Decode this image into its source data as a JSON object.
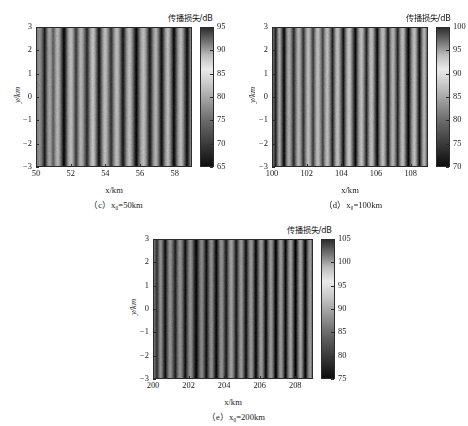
{
  "figure": {
    "colorbar_title": "传播损失/dB",
    "xlabel": "x/km",
    "ylabel": "y/km"
  },
  "chart_data": [
    {
      "type": "heatmap",
      "panel_id": "c",
      "title": "",
      "caption": "（c）x₀=50km",
      "caption_plain": "(c) x0=50km",
      "xlabel": "x/km",
      "ylabel": "y/km",
      "colorbar_label": "传播损失/dB",
      "xlim": [
        50,
        59
      ],
      "ylim": [
        -3,
        3
      ],
      "xticks": [
        50,
        52,
        54,
        56,
        58
      ],
      "yticks": [
        3,
        2,
        1,
        0,
        -1,
        -2,
        -3
      ],
      "clim": [
        65,
        95
      ],
      "cbticks": [
        65,
        70,
        75,
        80,
        85,
        90,
        95
      ],
      "grid": false,
      "colormap": "gray",
      "description": "Vertical interference striations of propagation loss; values ~65-95 dB, invariant in y.",
      "stripe_profile_db": [
        80,
        79,
        78,
        80,
        83,
        87,
        92,
        88,
        82,
        78,
        76,
        77,
        80,
        84,
        82,
        78,
        75,
        74,
        76,
        80,
        85,
        90,
        94,
        91,
        86,
        80,
        76,
        74,
        73,
        75,
        79,
        84,
        88,
        85,
        80,
        76,
        74,
        75,
        78,
        82,
        86,
        90,
        87,
        82,
        77,
        74,
        72,
        74,
        78,
        83,
        88,
        93,
        89,
        84,
        79,
        75,
        73,
        74,
        77,
        81,
        85,
        89,
        86,
        81,
        77,
        74,
        73,
        75,
        79,
        84,
        89,
        92,
        88,
        83,
        78,
        75,
        73,
        74,
        77,
        81,
        86,
        91,
        94,
        90,
        85,
        80,
        76,
        74,
        73,
        75,
        78,
        83,
        88,
        92,
        89,
        84,
        79,
        76,
        74,
        76,
        80,
        85,
        90,
        93,
        88,
        83,
        78,
        75,
        73,
        75,
        79,
        84,
        89,
        94,
        90,
        85,
        80,
        76,
        74,
        73,
        76,
        80,
        85,
        90,
        93,
        89,
        84,
        79
      ]
    },
    {
      "type": "heatmap",
      "panel_id": "d",
      "title": "",
      "caption": "（d）x₀=100km",
      "caption_plain": "(d) x0=100km",
      "xlabel": "x/km",
      "ylabel": "y/km",
      "colorbar_label": "传播损失/dB",
      "xlim": [
        100,
        109
      ],
      "ylim": [
        -3,
        3
      ],
      "xticks": [
        100,
        102,
        104,
        106,
        108
      ],
      "yticks": [
        3,
        2,
        1,
        0,
        -1,
        -2,
        -3
      ],
      "clim": [
        70,
        100
      ],
      "cbticks": [
        70,
        75,
        80,
        85,
        90,
        95,
        100
      ],
      "grid": false,
      "colormap": "gray",
      "description": "Vertical interference striations of propagation loss; values ~70-100 dB, invariant in y.",
      "stripe_profile_db": [
        88,
        92,
        96,
        90,
        84,
        80,
        83,
        89,
        95,
        99,
        93,
        86,
        82,
        80,
        82,
        86,
        91,
        95,
        90,
        85,
        81,
        79,
        81,
        85,
        90,
        94,
        89,
        84,
        80,
        78,
        80,
        84,
        89,
        93,
        88,
        83,
        79,
        78,
        80,
        84,
        88,
        92,
        87,
        82,
        79,
        78,
        81,
        86,
        91,
        96,
        91,
        85,
        80,
        78,
        79,
        83,
        88,
        93,
        98,
        92,
        86,
        81,
        78,
        77,
        80,
        85,
        90,
        95,
        99,
        93,
        87,
        82,
        79,
        78,
        80,
        85,
        90,
        96,
        91,
        85,
        80,
        78,
        79,
        83,
        89,
        94,
        99,
        93,
        87,
        82,
        79,
        78,
        81,
        86,
        92,
        97,
        91,
        85,
        81,
        79,
        81,
        86,
        91,
        96,
        90,
        84,
        80,
        78,
        80,
        85,
        91,
        96,
        99,
        93,
        87,
        82,
        79,
        78,
        81,
        87,
        93,
        98,
        92,
        86,
        81,
        79,
        82,
        88
      ]
    },
    {
      "type": "heatmap",
      "panel_id": "e",
      "title": "",
      "caption": "（e）x₀=200km",
      "caption_plain": "(e) x0=200km",
      "xlabel": "x/km",
      "ylabel": "y/km",
      "colorbar_label": "传播损失/dB",
      "xlim": [
        200,
        209
      ],
      "ylim": [
        -3,
        3
      ],
      "xticks": [
        200,
        202,
        204,
        206,
        208
      ],
      "yticks": [
        3,
        2,
        1,
        0,
        -1,
        -2,
        -3
      ],
      "clim": [
        75,
        105
      ],
      "cbticks": [
        75,
        80,
        85,
        90,
        95,
        100,
        105
      ],
      "grid": false,
      "colormap": "gray",
      "description": "Vertical interference striations of propagation loss; values ~75-105 dB, invariant in y.",
      "stripe_profile_db": [
        92,
        95,
        99,
        96,
        91,
        88,
        90,
        95,
        100,
        103,
        98,
        93,
        89,
        88,
        90,
        94,
        98,
        101,
        97,
        92,
        89,
        88,
        90,
        94,
        99,
        103,
        99,
        94,
        90,
        88,
        89,
        93,
        98,
        102,
        104,
        100,
        95,
        91,
        89,
        90,
        94,
        99,
        103,
        99,
        94,
        90,
        88,
        90,
        95,
        100,
        104,
        100,
        95,
        90,
        88,
        89,
        93,
        98,
        102,
        97,
        92,
        88,
        86,
        88,
        92,
        97,
        102,
        98,
        93,
        89,
        87,
        89,
        94,
        99,
        103,
        98,
        93,
        89,
        87,
        89,
        94,
        100,
        104,
        99,
        94,
        89,
        87,
        88,
        93,
        99,
        104,
        99,
        93,
        89,
        87,
        89,
        94,
        100,
        105,
        100,
        94,
        89,
        87,
        89,
        94,
        100,
        104,
        98,
        92,
        88,
        86,
        89,
        95,
        101,
        105,
        99,
        93,
        88,
        86,
        89,
        95,
        101,
        104,
        98,
        92,
        88,
        87,
        91
      ]
    }
  ]
}
